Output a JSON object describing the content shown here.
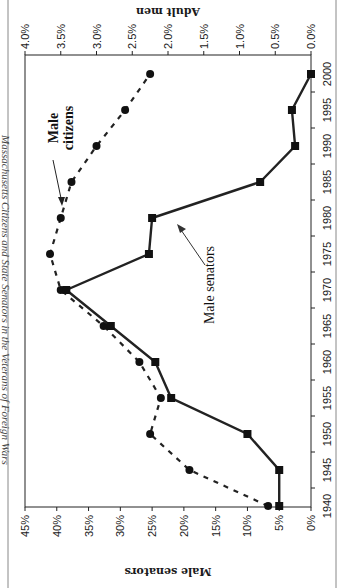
{
  "chart_data": {
    "type": "line",
    "title": "Massachusetts Citizens and State Senators in the Veterans of Foreign Wars",
    "orientation": "rotated 90 degrees (x axis vertical, years increase upward); image shown rotated",
    "xlabel": "",
    "x": [
      1940,
      1945,
      1950,
      1955,
      1960,
      1965,
      1970,
      1975,
      1980,
      1985,
      1990,
      1995,
      2000
    ],
    "x_tick_labels": [
      "1940",
      "1945",
      "1950",
      "1955",
      "1960",
      "1965",
      "1970",
      "1975",
      "1980",
      "1985",
      "1990",
      "1995",
      "2000"
    ],
    "y_primary": {
      "label": "Male senators",
      "range": [
        0,
        45
      ],
      "tick_labels": [
        "0%",
        "5%",
        "10%",
        "15%",
        "20%",
        "25%",
        "30%",
        "35%",
        "40%",
        "45%"
      ]
    },
    "y_secondary": {
      "label": "Adult men",
      "range": [
        0,
        4.0
      ],
      "tick_labels": [
        "0.0%",
        "0.5%",
        "1.0%",
        "1.5%",
        "2.0%",
        "2.5%",
        "3.0%",
        "3.5%",
        "4.0%"
      ]
    },
    "series": [
      {
        "name": "Male senators",
        "axis": "primary",
        "marker": "square",
        "line": "solid",
        "values": [
          5,
          5,
          10,
          22,
          24.5,
          31.5,
          38.5,
          25.5,
          25,
          8,
          2.5,
          3,
          0
        ]
      },
      {
        "name": "Male citizens",
        "axis": "secondary",
        "marker": "circle",
        "line": "dashed",
        "values": [
          0.6,
          1.7,
          2.25,
          2.1,
          2.4,
          2.9,
          3.5,
          3.65,
          3.5,
          3.35,
          3.0,
          2.6,
          2.25
        ]
      }
    ],
    "annotations": [
      "Male citizens",
      "Male senators"
    ],
    "grid": false,
    "legend": "none (inline labels with arrows)"
  },
  "title": {
    "text": "Massachusetts Citizens and State Senators in the Veterans of Foreign Wars"
  },
  "axes": {
    "bottom_title": "Male senators",
    "top_title": "Adult men"
  },
  "labels": {
    "citizens_line1": "Male",
    "citizens_line2": "citizens",
    "senators": "Male senators"
  }
}
